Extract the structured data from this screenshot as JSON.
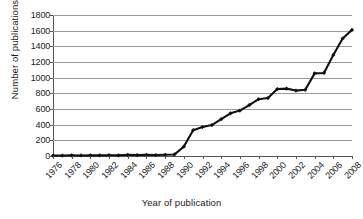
{
  "chart_data": {
    "type": "line",
    "title": "",
    "xlabel": "Year of publication",
    "ylabel": "Number of publications",
    "xlim": [
      1976,
      2008
    ],
    "ylim": [
      0,
      1800
    ],
    "ytick_step": 200,
    "yticks": [
      0,
      200,
      400,
      600,
      800,
      1000,
      1200,
      1400,
      1600,
      1800
    ],
    "xticks": [
      1976,
      1978,
      1980,
      1982,
      1984,
      1986,
      1988,
      1990,
      1992,
      1994,
      1996,
      1998,
      2000,
      2002,
      2004,
      2006,
      2008
    ],
    "xtick_labels": [
      "1976",
      "1978",
      "1980",
      "1982",
      "1984",
      "1986",
      "1988",
      "1990",
      "1992",
      "1994",
      "1996",
      "1998",
      "2000",
      "2002",
      "2004",
      "2006",
      "2008"
    ],
    "grid": "horizontal",
    "legend": "none",
    "marker": "diamond",
    "line_color": "#111111",
    "grid_color": "#9b9b9b",
    "axis_color": "#555555",
    "x": [
      1976,
      1977,
      1978,
      1979,
      1980,
      1981,
      1982,
      1983,
      1984,
      1985,
      1986,
      1987,
      1988,
      1989,
      1990,
      1991,
      1992,
      1993,
      1994,
      1995,
      1996,
      1997,
      1998,
      1999,
      2000,
      2001,
      2002,
      2003,
      2004,
      2005,
      2006,
      2007,
      2008
    ],
    "values": [
      5,
      6,
      8,
      7,
      9,
      8,
      10,
      9,
      14,
      12,
      15,
      13,
      16,
      20,
      120,
      330,
      370,
      395,
      470,
      545,
      580,
      650,
      725,
      740,
      855,
      860,
      835,
      845,
      1055,
      1060,
      1290,
      1500,
      1610
    ],
    "series": [
      {
        "name": "Number of publications",
        "values": [
          5,
          6,
          8,
          7,
          9,
          8,
          10,
          9,
          14,
          12,
          15,
          13,
          16,
          20,
          120,
          330,
          370,
          395,
          470,
          545,
          580,
          650,
          725,
          740,
          855,
          860,
          835,
          845,
          1055,
          1060,
          1290,
          1500,
          1610
        ]
      }
    ]
  },
  "axis_titles": {
    "x": "Year of publication",
    "y": "Number of publications"
  }
}
